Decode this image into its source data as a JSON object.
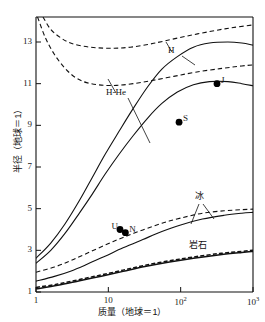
{
  "chart_data": {
    "type": "line",
    "title": "",
    "xlabel": "质量（地球＝1）",
    "ylabel": "半径（地球＝1）",
    "xscale": "log",
    "yscale": "linear",
    "xlim": [
      1,
      1000
    ],
    "ylim": [
      1,
      14.2
    ],
    "grid": false,
    "legend_position": "inline-annotations",
    "xticks": [
      {
        "value": 1,
        "label": "1"
      },
      {
        "value": 10,
        "label": "10"
      },
      {
        "value": 100,
        "label": "10",
        "exponent": "2"
      },
      {
        "value": 1000,
        "label": "10",
        "exponent": "3"
      }
    ],
    "yticks": [
      {
        "value": 1,
        "label": "1"
      },
      {
        "value": 3,
        "label": "3"
      },
      {
        "value": 5,
        "label": "5"
      },
      {
        "value": 7,
        "label": "7"
      },
      {
        "value": 9,
        "label": "9"
      },
      {
        "value": 11,
        "label": "11"
      },
      {
        "value": 13,
        "label": "13"
      }
    ],
    "series": [
      {
        "name": "H-dashed",
        "style": "dashed",
        "points": [
          [
            1.25,
            14.2
          ],
          [
            1.6,
            13.6
          ],
          [
            2.2,
            13.2
          ],
          [
            3.0,
            12.95
          ],
          [
            4.5,
            12.8
          ],
          [
            7,
            12.72
          ],
          [
            12,
            12.7
          ],
          [
            20,
            12.75
          ],
          [
            35,
            12.88
          ],
          [
            60,
            13.05
          ],
          [
            120,
            13.28
          ],
          [
            250,
            13.5
          ],
          [
            500,
            13.68
          ],
          [
            1000,
            13.82
          ]
        ]
      },
      {
        "name": "H-He-dashed",
        "style": "dashed",
        "points": [
          [
            1.05,
            14.2
          ],
          [
            1.35,
            13.2
          ],
          [
            1.8,
            12.4
          ],
          [
            2.5,
            11.75
          ],
          [
            3.5,
            11.3
          ],
          [
            5,
            11.05
          ],
          [
            8,
            10.93
          ],
          [
            13,
            10.92
          ],
          [
            22,
            11.0
          ],
          [
            40,
            11.15
          ],
          [
            80,
            11.35
          ],
          [
            160,
            11.55
          ],
          [
            350,
            11.72
          ],
          [
            700,
            11.85
          ],
          [
            1000,
            11.9
          ]
        ]
      },
      {
        "name": "H-solid",
        "style": "solid",
        "points": [
          [
            1,
            2.62
          ],
          [
            1.6,
            3.35
          ],
          [
            2.5,
            4.25
          ],
          [
            4,
            5.4
          ],
          [
            6,
            6.5
          ],
          [
            9,
            7.6
          ],
          [
            14,
            8.7
          ],
          [
            22,
            9.8
          ],
          [
            35,
            10.85
          ],
          [
            55,
            11.7
          ],
          [
            90,
            12.3
          ],
          [
            150,
            12.75
          ],
          [
            250,
            12.95
          ],
          [
            450,
            13.0
          ],
          [
            700,
            12.95
          ],
          [
            1000,
            12.85
          ]
        ]
      },
      {
        "name": "H-He-solid",
        "style": "solid",
        "points": [
          [
            1,
            2.38
          ],
          [
            1.6,
            3.0
          ],
          [
            2.5,
            3.8
          ],
          [
            4,
            4.8
          ],
          [
            6,
            5.7
          ],
          [
            9,
            6.65
          ],
          [
            14,
            7.6
          ],
          [
            22,
            8.5
          ],
          [
            35,
            9.35
          ],
          [
            55,
            10.05
          ],
          [
            90,
            10.6
          ],
          [
            150,
            10.95
          ],
          [
            250,
            11.1
          ],
          [
            450,
            11.1
          ],
          [
            700,
            11.0
          ],
          [
            1000,
            10.9
          ]
        ]
      },
      {
        "name": "ice-dashed",
        "style": "dashed",
        "points": [
          [
            1,
            1.95
          ],
          [
            1.8,
            2.2
          ],
          [
            3,
            2.5
          ],
          [
            5,
            2.85
          ],
          [
            9,
            3.25
          ],
          [
            16,
            3.62
          ],
          [
            30,
            3.98
          ],
          [
            55,
            4.3
          ],
          [
            100,
            4.55
          ],
          [
            200,
            4.78
          ],
          [
            400,
            4.9
          ],
          [
            700,
            4.95
          ],
          [
            1000,
            4.98
          ]
        ]
      },
      {
        "name": "ice-solid",
        "style": "solid",
        "points": [
          [
            1,
            1.52
          ],
          [
            1.8,
            1.75
          ],
          [
            3,
            2.0
          ],
          [
            5,
            2.32
          ],
          [
            9,
            2.72
          ],
          [
            16,
            3.12
          ],
          [
            30,
            3.52
          ],
          [
            55,
            3.9
          ],
          [
            100,
            4.22
          ],
          [
            200,
            4.5
          ],
          [
            400,
            4.68
          ],
          [
            700,
            4.78
          ],
          [
            1000,
            4.82
          ]
        ]
      },
      {
        "name": "rock-dashed",
        "style": "dashed",
        "points": [
          [
            1,
            1.22
          ],
          [
            2,
            1.38
          ],
          [
            4,
            1.6
          ],
          [
            8,
            1.82
          ],
          [
            16,
            2.05
          ],
          [
            32,
            2.28
          ],
          [
            70,
            2.5
          ],
          [
            150,
            2.68
          ],
          [
            350,
            2.85
          ],
          [
            700,
            2.95
          ],
          [
            1000,
            3.0
          ]
        ]
      },
      {
        "name": "rock-solid",
        "style": "solid",
        "points": [
          [
            1,
            1.15
          ],
          [
            2,
            1.32
          ],
          [
            4,
            1.54
          ],
          [
            8,
            1.76
          ],
          [
            16,
            1.99
          ],
          [
            32,
            2.22
          ],
          [
            70,
            2.44
          ],
          [
            150,
            2.62
          ],
          [
            350,
            2.79
          ],
          [
            700,
            2.9
          ],
          [
            1000,
            2.95
          ]
        ]
      }
    ],
    "markers": [
      {
        "label": "J",
        "x": 318,
        "y": 11.0,
        "label_side": "right"
      },
      {
        "label": "S",
        "x": 95,
        "y": 9.15,
        "label_side": "right"
      },
      {
        "label": "U",
        "x": 14.5,
        "y": 4.0,
        "label_side": "left"
      },
      {
        "label": "N",
        "x": 17.2,
        "y": 3.85,
        "label_side": "right"
      }
    ],
    "annotations": [
      {
        "text": "H",
        "name": "label-h"
      },
      {
        "text": "H-He",
        "name": "label-h-he"
      },
      {
        "text": "冰",
        "name": "label-ice"
      },
      {
        "text": "岩石",
        "name": "label-rock"
      }
    ],
    "colors": {
      "curve": "#111111",
      "axis": "#111111",
      "marker": "#000000",
      "background": "#ffffff"
    }
  }
}
